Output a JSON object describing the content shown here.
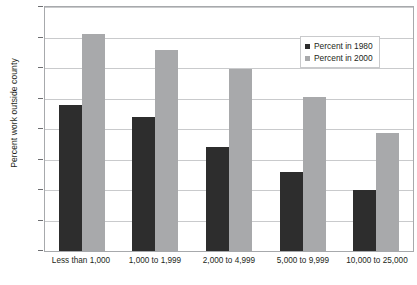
{
  "chart_data": {
    "type": "bar",
    "title": "",
    "xlabel": "",
    "ylabel": "Percent work outside county",
    "ylim": [
      0,
      40
    ],
    "ytick_step": 5,
    "yticks": [
      40,
      35,
      30,
      25,
      20,
      15,
      10,
      5,
      0
    ],
    "grid": true,
    "legend_position": "top-right",
    "categories": [
      "Less than 1,000",
      "1,000 to 1,999",
      "2,000 to 4,999",
      "5,000 to 9,999",
      "10,000 to 25,000"
    ],
    "series": [
      {
        "name": "Percent in 1980",
        "color": "#2d2d2d",
        "values": [
          24.0,
          22.0,
          17.0,
          13.0,
          10.0
        ]
      },
      {
        "name": "Percent in 2000",
        "color": "#a8a9ab",
        "values": [
          35.5,
          33.0,
          29.8,
          25.3,
          19.3
        ]
      }
    ]
  },
  "colors": {
    "series_1980": "#2d2d2d",
    "series_2000": "#a8a9ab",
    "gridline": "#c9cacc",
    "axis": "#a7a9ac",
    "text": "#231f20",
    "background": "#ffffff"
  },
  "legend": {
    "items": [
      {
        "label": "Percent in 1980",
        "swatch": "legend-swatch-1980"
      },
      {
        "label": "Percent in 2000",
        "swatch": "legend-swatch-2000"
      }
    ]
  }
}
